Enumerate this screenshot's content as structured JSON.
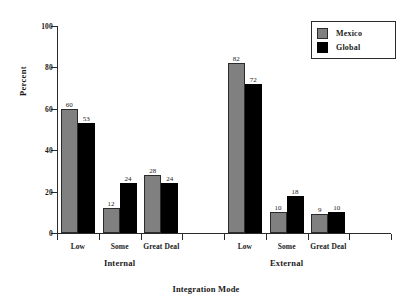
{
  "chart_data": {
    "type": "bar",
    "title": "",
    "subtitle": "",
    "xlabel": "Integration Mode",
    "ylabel": "Percent",
    "ylim": [
      0,
      100
    ],
    "yticks": [
      0,
      20,
      40,
      60,
      80,
      100
    ],
    "ytick_labels": [
      "0",
      "20",
      "40",
      "60",
      "80",
      "100"
    ],
    "grid": false,
    "legend_position": "top-right",
    "categories": [
      "Low",
      "Some",
      "Great Deal",
      "Low",
      "Some",
      "Great Deal"
    ],
    "groups": [
      {
        "name": "Internal",
        "categories": [
          "Low",
          "Some",
          "Great Deal"
        ]
      },
      {
        "name": "External",
        "categories": [
          "Low",
          "Some",
          "Great Deal"
        ]
      }
    ],
    "series": [
      {
        "name": "Mexico",
        "color": "#808080",
        "values": [
          60,
          12,
          28,
          82,
          10,
          9
        ]
      },
      {
        "name": "Global",
        "color": "#000000",
        "values": [
          53,
          24,
          24,
          72,
          18,
          10
        ]
      }
    ],
    "bars": [
      {
        "group": "Internal",
        "category": "Low",
        "series": "Mexico",
        "value": 60,
        "label": "60"
      },
      {
        "group": "Internal",
        "category": "Low",
        "series": "Global",
        "value": 53,
        "label": "53"
      },
      {
        "group": "Internal",
        "category": "Some",
        "series": "Mexico",
        "value": 12,
        "label": "12"
      },
      {
        "group": "Internal",
        "category": "Some",
        "series": "Global",
        "value": 24,
        "label": "24"
      },
      {
        "group": "Internal",
        "category": "Great Deal",
        "series": "Mexico",
        "value": 28,
        "label": "28"
      },
      {
        "group": "Internal",
        "category": "Great Deal",
        "series": "Global",
        "value": 24,
        "label": "24"
      },
      {
        "group": "External",
        "category": "Low",
        "series": "Mexico",
        "value": 82,
        "label": "82"
      },
      {
        "group": "External",
        "category": "Low",
        "series": "Global",
        "value": 72,
        "label": "72"
      },
      {
        "group": "External",
        "category": "Some",
        "series": "Mexico",
        "value": 10,
        "label": "10"
      },
      {
        "group": "External",
        "category": "Some",
        "series": "Global",
        "value": 18,
        "label": "18"
      },
      {
        "group": "External",
        "category": "Great Deal",
        "series": "Mexico",
        "value": 9,
        "label": "9"
      },
      {
        "group": "External",
        "category": "Great Deal",
        "series": "Global",
        "value": 10,
        "label": "10"
      }
    ]
  },
  "axis": {
    "y_title": "Percent",
    "x_title": "Integration Mode",
    "y_tick_labels": [
      "100",
      "80",
      "60",
      "40",
      "20",
      "0"
    ]
  },
  "legend": {
    "items": [
      {
        "label": "Mexico",
        "color": "#808080"
      },
      {
        "label": "Global",
        "color": "#000000"
      }
    ]
  },
  "categories": {
    "internal": [
      "Low",
      "Some",
      "Great Deal"
    ],
    "external": [
      "Low",
      "Some",
      "Great Deal"
    ]
  },
  "group_labels": [
    "Internal",
    "External"
  ]
}
